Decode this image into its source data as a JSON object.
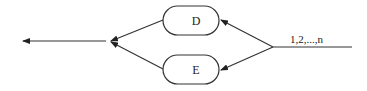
{
  "diagram": {
    "nodes": [
      {
        "id": "D",
        "label": "D"
      },
      {
        "id": "E",
        "label": "E"
      }
    ],
    "input_label": "1,2,...,n",
    "edges": [
      {
        "from": "input",
        "to": "D"
      },
      {
        "from": "input",
        "to": "E"
      },
      {
        "from": "D",
        "to": "merge"
      },
      {
        "from": "E",
        "to": "merge"
      },
      {
        "from": "merge",
        "to": "output"
      }
    ]
  }
}
